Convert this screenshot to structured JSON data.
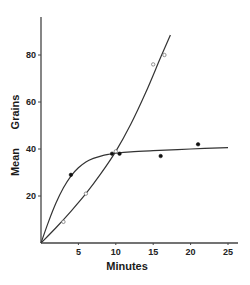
{
  "chart_data": {
    "type": "line",
    "title": "",
    "xlabel": "Minutes",
    "ylabel": "Mean Grains",
    "ylabel_parts": [
      "Mean",
      "Grains"
    ],
    "xlim": [
      0,
      26
    ],
    "ylim": [
      0,
      95
    ],
    "xticks": [
      5,
      10,
      15,
      20,
      25
    ],
    "xtick_labels": [
      "5",
      "10",
      "15",
      "20",
      "25"
    ],
    "yticks": [
      20,
      40,
      60,
      80
    ],
    "ytick_labels": [
      "20",
      "40",
      "60",
      "80"
    ],
    "grid": false,
    "legend": null,
    "series": [
      {
        "name": "filled-circles",
        "marker": "filled-circle",
        "points": [
          [
            0,
            0
          ],
          [
            4,
            29
          ],
          [
            9.5,
            38
          ],
          [
            10.5,
            38
          ],
          [
            16,
            37
          ],
          [
            21,
            42
          ]
        ],
        "curve": [
          [
            0,
            0
          ],
          [
            1,
            9
          ],
          [
            2,
            17
          ],
          [
            3,
            23.5
          ],
          [
            4,
            28.5
          ],
          [
            5,
            32
          ],
          [
            6,
            34.5
          ],
          [
            7,
            36
          ],
          [
            8,
            37
          ],
          [
            9,
            37.7
          ],
          [
            10,
            38.2
          ],
          [
            12,
            38.8
          ],
          [
            15,
            39.3
          ],
          [
            20,
            40
          ],
          [
            25,
            40.6
          ]
        ]
      },
      {
        "name": "open-circles",
        "marker": "open-circle",
        "points": [
          [
            0,
            0
          ],
          [
            3,
            9
          ],
          [
            6,
            21
          ],
          [
            10,
            39
          ],
          [
            15,
            76
          ],
          [
            16.5,
            80
          ]
        ],
        "curve": [
          [
            0,
            0
          ],
          [
            2,
            6.5
          ],
          [
            4,
            13.5
          ],
          [
            6,
            21
          ],
          [
            8,
            29.5
          ],
          [
            10,
            39
          ],
          [
            12,
            50.5
          ],
          [
            14,
            64
          ],
          [
            16,
            79
          ],
          [
            17.3,
            88.5
          ]
        ]
      }
    ]
  }
}
